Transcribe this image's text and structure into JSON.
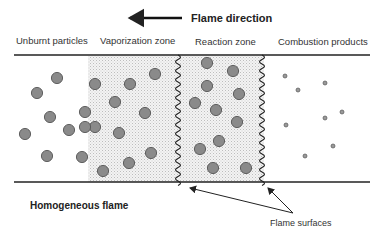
{
  "title": "Flame direction",
  "zones": [
    {
      "label": "Unburnt particles",
      "x": 16
    },
    {
      "label": "Vaporization zone",
      "x": 100
    },
    {
      "label": "Reaction zone",
      "x": 195
    },
    {
      "label": "Combustion products",
      "x": 278
    }
  ],
  "caption": "Homogeneous flame",
  "annotation": "Flame surfaces",
  "colors": {
    "line": "#222222",
    "particle_fill": "#8a8a8a",
    "particle_stroke": "#555555",
    "stipple": "#c8c8c8"
  },
  "particles_large": [
    [
      57,
      78
    ],
    [
      37,
      93
    ],
    [
      50,
      117
    ],
    [
      25,
      134
    ],
    [
      69,
      130
    ],
    [
      47,
      156
    ],
    [
      82,
      157
    ],
    [
      85,
      112
    ],
    [
      95,
      84
    ],
    [
      130,
      84
    ],
    [
      155,
      74
    ],
    [
      115,
      102
    ],
    [
      145,
      113
    ],
    [
      95,
      127
    ],
    [
      119,
      133
    ],
    [
      151,
      153
    ],
    [
      129,
      163
    ],
    [
      103,
      171
    ],
    [
      85,
      127
    ],
    [
      207,
      63
    ],
    [
      233,
      71
    ],
    [
      207,
      86
    ],
    [
      239,
      94
    ],
    [
      195,
      103
    ],
    [
      216,
      110
    ],
    [
      237,
      122
    ],
    [
      219,
      141
    ],
    [
      200,
      149
    ],
    [
      213,
      168
    ],
    [
      246,
      168
    ]
  ],
  "particles_small": [
    [
      285,
      76
    ],
    [
      298,
      90
    ],
    [
      325,
      83
    ],
    [
      342,
      112
    ],
    [
      325,
      118
    ],
    [
      286,
      125
    ],
    [
      333,
      146
    ],
    [
      305,
      156
    ]
  ]
}
